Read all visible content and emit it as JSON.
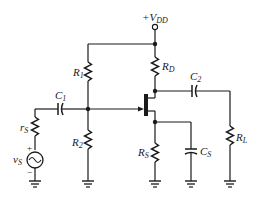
{
  "diagram": {
    "type": "circuit-schematic",
    "labels": {
      "supply": "+V",
      "supply_sub": "DD",
      "r1": "R",
      "r1_sub": "1",
      "r2": "R",
      "r2_sub": "2",
      "rd": "R",
      "rd_sub": "D",
      "rs": "R",
      "rs_sub": "S",
      "rl": "R",
      "rl_sub": "L",
      "c1": "C",
      "c1_sub": "1",
      "c2": "C",
      "c2_sub": "2",
      "cs": "C",
      "cs_sub": "S",
      "src_r": "r",
      "src_r_sub": "S",
      "src_v": "v",
      "src_v_sub": "S",
      "plus": "+",
      "minus": "−"
    },
    "components": [
      {
        "id": "VDD",
        "kind": "supply-terminal"
      },
      {
        "id": "R1",
        "kind": "resistor",
        "between": [
          "VDD-rail",
          "gate-node"
        ]
      },
      {
        "id": "R2",
        "kind": "resistor",
        "between": [
          "gate-node",
          "ground"
        ]
      },
      {
        "id": "RD",
        "kind": "resistor",
        "between": [
          "VDD",
          "drain-node"
        ]
      },
      {
        "id": "RS",
        "kind": "resistor",
        "between": [
          "source-node",
          "ground"
        ]
      },
      {
        "id": "CS",
        "kind": "capacitor",
        "between": [
          "source-node",
          "ground"
        ]
      },
      {
        "id": "C1",
        "kind": "capacitor",
        "between": [
          "rS",
          "gate-node"
        ]
      },
      {
        "id": "C2",
        "kind": "capacitor",
        "between": [
          "drain-node",
          "RL"
        ]
      },
      {
        "id": "RL",
        "kind": "resistor",
        "between": [
          "C2",
          "ground"
        ]
      },
      {
        "id": "rS",
        "kind": "resistor",
        "between": [
          "C1",
          "vS"
        ]
      },
      {
        "id": "vS",
        "kind": "ac-source",
        "between": [
          "rS",
          "ground"
        ]
      },
      {
        "id": "Q1",
        "kind": "n-channel-jfet"
      }
    ]
  }
}
